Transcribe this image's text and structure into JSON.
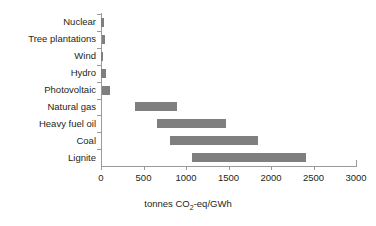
{
  "chart_data": {
    "type": "bar",
    "orientation": "horizontal",
    "subtype": "floating-range-bar",
    "title": "",
    "xlabel": "tonnes CO2-eq/GWh",
    "xlabel_parts": {
      "pre": "tonnes CO",
      "sub": "2",
      "post": "-eq/GWh"
    },
    "ylabel": "",
    "xlim": [
      0,
      3000
    ],
    "xticks": [
      0,
      500,
      1000,
      1500,
      2000,
      2500,
      3000
    ],
    "xtick_labels": [
      "0",
      "500",
      "1000",
      "1500",
      "2000",
      "2500",
      "3000"
    ],
    "grid": false,
    "legend": false,
    "bar_color": "#7f7f7f",
    "axis_color": "#9a9a9a",
    "categories": [
      "Nuclear",
      "Tree plantations",
      "Wind",
      "Hydro",
      "Photovoltaic",
      "Natural gas",
      "Heavy fuel oil",
      "Coal",
      "Lignite"
    ],
    "ranges": [
      {
        "category": "Nuclear",
        "low": 5,
        "high": 30
      },
      {
        "category": "Tree plantations",
        "low": 10,
        "high": 50
      },
      {
        "category": "Wind",
        "low": 5,
        "high": 25
      },
      {
        "category": "Hydro",
        "low": 5,
        "high": 60
      },
      {
        "category": "Photovoltaic",
        "low": 15,
        "high": 105
      },
      {
        "category": "Natural gas",
        "low": 400,
        "high": 895
      },
      {
        "category": "Heavy fuel oil",
        "low": 660,
        "high": 1470
      },
      {
        "category": "Coal",
        "low": 810,
        "high": 1850
      },
      {
        "category": "Lignite",
        "low": 1070,
        "high": 2410
      }
    ]
  }
}
